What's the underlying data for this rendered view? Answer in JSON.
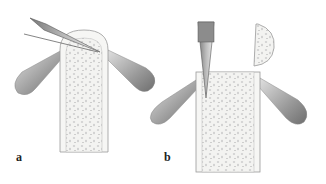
{
  "figure": {
    "panels": [
      {
        "label": "a",
        "description": "Elevation of periosteum flaps with retractors; scalpel incising bone tip"
      },
      {
        "label": "b",
        "description": "Osteotome cutting into bone with bone fragment lifted aside; retractors holding soft tissue"
      }
    ],
    "colors": {
      "background": "#ffffff",
      "bone_fill": "#f4f4f2",
      "bone_outline": "#9a9a9a",
      "cancellous_dots": "#bdbdbd",
      "retractor_dark": "#7a7a7a",
      "retractor_light": "#d0d0d0",
      "blade": "#e8e8e8"
    }
  }
}
